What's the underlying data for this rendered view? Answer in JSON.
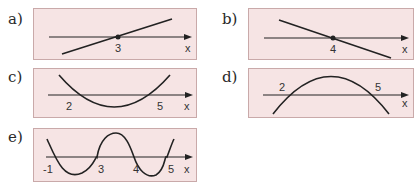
{
  "panels": [
    {
      "id": "a",
      "label": "a)",
      "axis_label": "x",
      "ticks": [
        {
          "text": "3"
        }
      ],
      "curve": "increasing line crossing x-axis at 3"
    },
    {
      "id": "b",
      "label": "b)",
      "axis_label": "x",
      "ticks": [
        {
          "text": "4"
        }
      ],
      "curve": "decreasing line crossing x-axis at 4"
    },
    {
      "id": "c",
      "label": "c)",
      "axis_label": "x",
      "ticks": [
        {
          "text": "2"
        },
        {
          "text": "5"
        }
      ],
      "curve": "upward parabola with roots 2 and 5"
    },
    {
      "id": "d",
      "label": "d)",
      "axis_label": "x",
      "ticks": [
        {
          "text": "2"
        },
        {
          "text": "5"
        }
      ],
      "curve": "downward parabola with roots 2 and 5"
    },
    {
      "id": "e",
      "label": "e)",
      "axis_label": "x",
      "ticks": [
        {
          "text": "-1"
        },
        {
          "text": "3"
        },
        {
          "text": "4"
        },
        {
          "text": "5"
        }
      ],
      "curve": "quartic-like wave with roots -1, 3, 4, 5"
    }
  ],
  "colors": {
    "panel_bg": "#f6e4e4",
    "panel_border": "#c9a9a9",
    "curve": "#222222"
  }
}
